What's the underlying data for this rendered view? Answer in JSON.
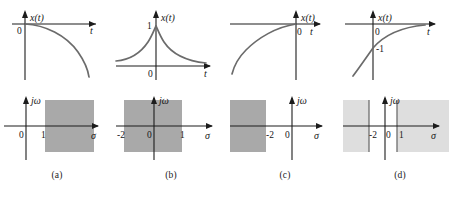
{
  "figure": {
    "colors": {
      "roc_dark": "#a9a9a9",
      "roc_light": "#dedede",
      "curve": "#6b6b6b",
      "axis": "#1c1c1c",
      "background": "#ffffff"
    }
  },
  "axis_labels": {
    "signal_y": "x(t)",
    "signal_x": "t",
    "splane_y": "jω",
    "splane_x": "σ"
  },
  "panels": [
    {
      "id": "a",
      "label": "(a)",
      "signal": {
        "origin_label": "0",
        "y_labels": [],
        "shape": "growing-negative-exponential",
        "note": "x(t) starts at 0 and decreases, accelerating downward for t>0"
      },
      "splane": {
        "origin_label": "0",
        "tick_labels": [
          "1"
        ],
        "roc": {
          "type": "right-half-strip",
          "shade": "dark",
          "left_bound": "1",
          "right_bound": "",
          "poles": []
        }
      }
    },
    {
      "id": "b",
      "label": "(b)",
      "signal": {
        "origin_label": "0",
        "y_labels": [
          "1"
        ],
        "shape": "two-sided-decaying-exponential",
        "note": "x(t) peaks at 1 at t=0 and decays on both sides"
      },
      "splane": {
        "origin_label": "0",
        "tick_labels": [
          "-2",
          "1"
        ],
        "roc": {
          "type": "vertical-strip",
          "shade": "dark",
          "left_bound": "-2",
          "right_bound": "1",
          "poles": []
        }
      }
    },
    {
      "id": "c",
      "label": "(c)",
      "signal": {
        "origin_label": "0",
        "y_labels": [],
        "shape": "left-sided-rising-exponential",
        "note": "x(t) rises from negative values for t<0 reaching 0 at t=0"
      },
      "splane": {
        "origin_label": "0",
        "tick_labels": [
          "-2"
        ],
        "roc": {
          "type": "left-half-strip",
          "shade": "dark",
          "left_bound": "",
          "right_bound": "-2",
          "poles": []
        }
      }
    },
    {
      "id": "d",
      "label": "(d)",
      "signal": {
        "origin_label": "0",
        "y_labels": [
          "-1"
        ],
        "shape": "rising-exponential-through-minus-one",
        "note": "x(t) rises from below, passes through -1 at t=0, asymptotes to 0"
      },
      "splane": {
        "origin_label": "0",
        "tick_labels": [
          "-2",
          "1"
        ],
        "roc": {
          "type": "two-outer-half-planes",
          "shade": "light",
          "left_bound": "-2",
          "right_bound": "1",
          "poles": [
            "-2",
            "1"
          ]
        }
      }
    }
  ]
}
